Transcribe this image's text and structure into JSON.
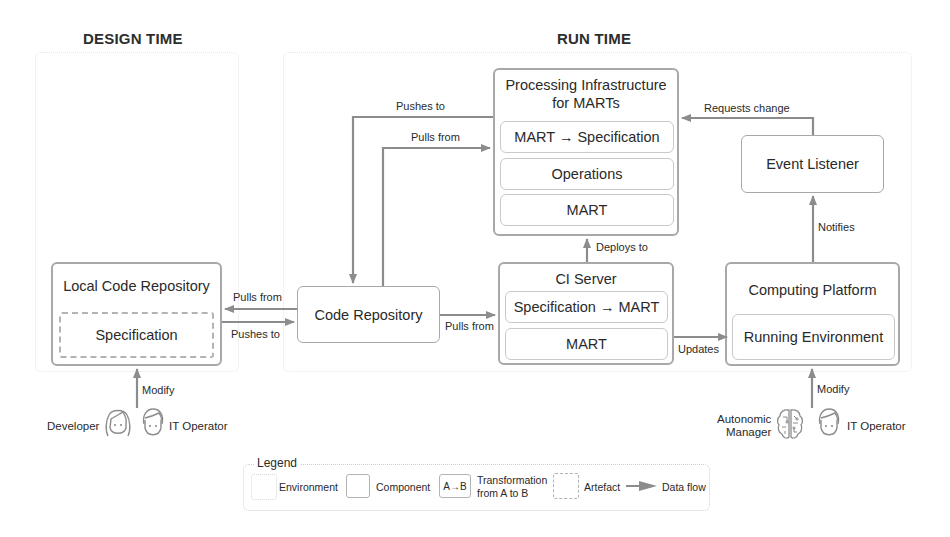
{
  "sections": {
    "design_time": "DESIGN TIME",
    "run_time": "RUN TIME"
  },
  "components": {
    "local_code_repository": {
      "title": "Local Code Repository",
      "artefact": "Specification"
    },
    "code_repository": {
      "title": "Code Repository"
    },
    "processing_infrastructure": {
      "title_line1": "Processing Infrastructure",
      "title_line2": "for MARTs",
      "items": [
        "MART → Specification",
        "Operations",
        "MART"
      ]
    },
    "ci_server": {
      "title": "CI Server",
      "items": [
        "Specification → MART",
        "MART"
      ]
    },
    "event_listener": {
      "title": "Event Listener"
    },
    "computing_platform": {
      "title": "Computing Platform",
      "items": [
        "Running Environment"
      ]
    }
  },
  "flows": {
    "code_to_local_pulls": "Pulls from",
    "local_to_code_pushes": "Pushes to",
    "code_to_ci_pulls": "Pulls from",
    "infra_to_code_pushes": "Pushes to",
    "code_to_infra_pulls": "Pulls from",
    "ci_to_infra_deploys": "Deploys to",
    "ci_to_platform_updates": "Updates",
    "platform_to_listener_notifies": "Notifies",
    "listener_to_infra_requests": "Requests change",
    "actors_to_local_modify": "Modify",
    "actors_to_platform_modify": "Modify"
  },
  "actors": {
    "design_time": [
      {
        "label": "Developer",
        "icon": "developer-icon"
      },
      {
        "label": "IT Operator",
        "icon": "it-operator-icon"
      }
    ],
    "run_time": [
      {
        "label_line1": "Autonomic",
        "label_line2": "Manager",
        "icon": "brain-icon"
      },
      {
        "label": "IT Operator",
        "icon": "it-operator-icon"
      }
    ]
  },
  "legend": {
    "title": "Legend",
    "items": {
      "environment": "Environment",
      "component": "Component",
      "transformation_glyph": "A→B",
      "transformation_line1": "Transformation",
      "transformation_line2": "from A to B",
      "artefact": "Artefact",
      "data_flow": "Data flow"
    }
  },
  "colors": {
    "arrow": "#8c8c8c",
    "component_border": "#a8a8a8",
    "sub_border": "#c9c9c9",
    "environment_border": "#e6e6e6",
    "text": "#2a2a2a"
  }
}
